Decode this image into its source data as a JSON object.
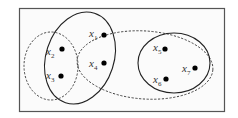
{
  "diagram": {
    "type": "hypergraph",
    "vertices": [
      {
        "id": "x1",
        "base": "x",
        "sub": "1",
        "cx": 104,
        "cy": 35
      },
      {
        "id": "x2",
        "base": "x",
        "sub": "2",
        "cx": 62,
        "cy": 49
      },
      {
        "id": "x3",
        "base": "x",
        "sub": "3",
        "cx": 61,
        "cy": 76
      },
      {
        "id": "x4",
        "base": "x",
        "sub": "4",
        "cx": 104,
        "cy": 63
      },
      {
        "id": "x5",
        "base": "x",
        "sub": "5",
        "cx": 165,
        "cy": 49
      },
      {
        "id": "x6",
        "base": "x",
        "sub": "6",
        "cx": 166,
        "cy": 79
      },
      {
        "id": "x7",
        "base": "x",
        "sub": "7",
        "cx": 195,
        "cy": 68
      }
    ],
    "hyperedges": [
      {
        "name": "solid-left",
        "style": "solid",
        "members": [
          "x1",
          "x2",
          "x3",
          "x4"
        ]
      },
      {
        "name": "dashed-left",
        "style": "dashed",
        "members": [
          "x2",
          "x3"
        ]
      },
      {
        "name": "dashed-large",
        "style": "dashed",
        "members": [
          "x1",
          "x4",
          "x5",
          "x6",
          "x7"
        ]
      },
      {
        "name": "solid-right",
        "style": "solid",
        "members": [
          "x5",
          "x6",
          "x7"
        ]
      }
    ]
  }
}
